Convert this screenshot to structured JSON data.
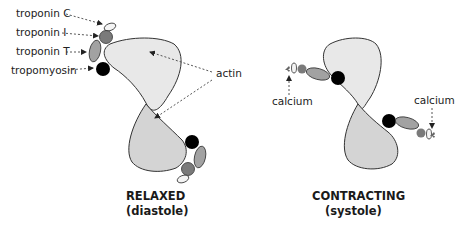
{
  "colors": {
    "actin_upper": "#e8e8e8",
    "actin_lower": "#d2d2d2",
    "troponin_c": "#f4f4f4",
    "troponin_i": "#7a7a7a",
    "troponin_t": "#a2a2a2",
    "tropomyosin": "#000000",
    "outline": "#333333",
    "arrow": "#444444"
  },
  "relaxed": {
    "labels": {
      "troponin_c": "troponin C",
      "troponin_i": "troponin I",
      "troponin_t": "troponin T",
      "tropomyosin": "tropomyosin",
      "actin": "actin"
    },
    "title": "RELAXED",
    "subtitle": "(diastole)"
  },
  "contracting": {
    "labels": {
      "calcium_left": "calcium",
      "calcium_right": "calcium"
    },
    "title": "CONTRACTING",
    "subtitle": "(systole)"
  }
}
